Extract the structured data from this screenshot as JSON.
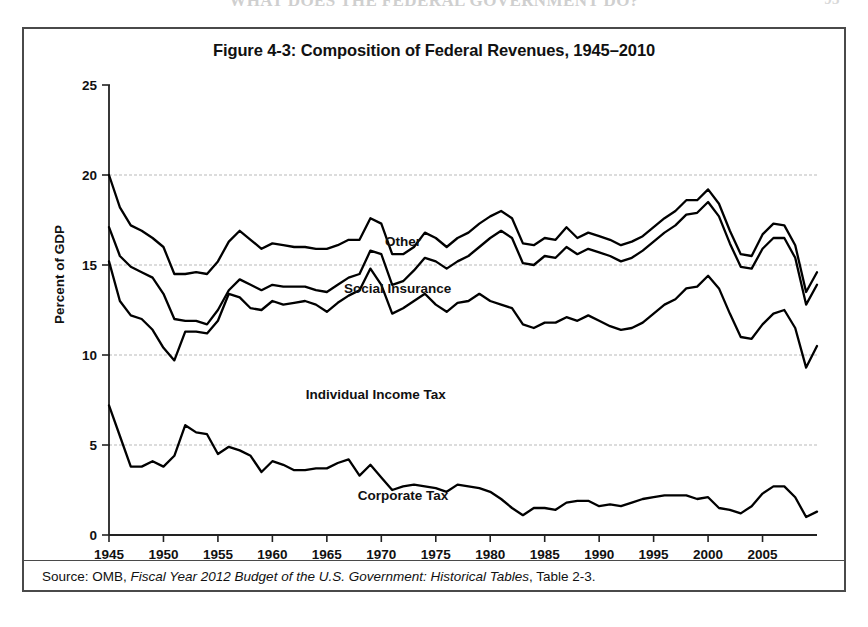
{
  "page": {
    "running_head": "WHAT DOES THE FEDERAL GOVERNMENT DO?",
    "page_number": "93"
  },
  "figure": {
    "title": "Figure 4-3: Composition of Federal Revenues, 1945–2010",
    "source_prefix": "Source: OMB, ",
    "source_italic": "Fiscal Year 2012 Budget of the U.S. Government: Historical Tables",
    "source_suffix": ", Table 2-3."
  },
  "axes": {
    "ylabel": "Percent of GDP",
    "yticks": [
      "0",
      "5",
      "10",
      "15",
      "20",
      "25"
    ],
    "xticks": [
      "1945",
      "1950",
      "1955",
      "1960",
      "1965",
      "1970",
      "1975",
      "1980",
      "1985",
      "1990",
      "1995",
      "2000",
      "2005"
    ]
  },
  "series_labels": {
    "other": "Other",
    "social_insurance": "Social Insurance",
    "individual_income_tax": "Individual Income Tax",
    "corporate_tax": "Corporate Tax"
  },
  "chart_data": {
    "type": "line",
    "title": "Figure 4-3: Composition of Federal Revenues, 1945–2010",
    "xlabel": "",
    "ylabel": "Percent of GDP",
    "xlim": [
      1945,
      2010
    ],
    "ylim": [
      0,
      25
    ],
    "ytick_interval": 5,
    "xtick_interval": 5,
    "grid": "horizontal-dashed",
    "legend": "inline-annotations",
    "note": "Cumulative (stacked) lines: each plotted line is the running total of the components beneath it. Corporate Tax is the lowest line; Individual Income Tax line = corporate + individual is NOT plotted separately — the stack order from bottom of the upper band upward is Individual Income Tax, Social Insurance, Other, each drawn as a cumulative total excluding corporate which is shown separately at the bottom.",
    "x": [
      1945,
      1946,
      1947,
      1948,
      1949,
      1950,
      1951,
      1952,
      1953,
      1954,
      1955,
      1956,
      1957,
      1958,
      1959,
      1960,
      1961,
      1962,
      1963,
      1964,
      1965,
      1966,
      1967,
      1968,
      1969,
      1970,
      1971,
      1972,
      1973,
      1974,
      1975,
      1976,
      1977,
      1978,
      1979,
      1980,
      1981,
      1982,
      1983,
      1984,
      1985,
      1986,
      1987,
      1988,
      1989,
      1990,
      1991,
      1992,
      1993,
      1994,
      1995,
      1996,
      1997,
      1998,
      1999,
      2000,
      2001,
      2002,
      2003,
      2004,
      2005,
      2006,
      2007,
      2008,
      2009,
      2010
    ],
    "series": [
      {
        "name": "Total (Other stacked on top) — top line",
        "label": "Other",
        "values": [
          20.0,
          18.2,
          17.2,
          16.9,
          16.5,
          16.0,
          14.5,
          14.5,
          14.6,
          14.5,
          15.2,
          16.3,
          16.9,
          16.4,
          15.9,
          16.2,
          16.1,
          16.0,
          16.0,
          15.9,
          15.9,
          16.1,
          16.4,
          16.4,
          17.6,
          17.3,
          15.6,
          15.6,
          16.0,
          16.8,
          16.5,
          16.0,
          16.5,
          16.8,
          17.3,
          17.7,
          18.0,
          17.6,
          16.2,
          16.1,
          16.5,
          16.4,
          17.1,
          16.5,
          16.8,
          16.6,
          16.4,
          16.1,
          16.3,
          16.6,
          17.1,
          17.6,
          18.0,
          18.6,
          18.6,
          19.2,
          18.4,
          16.9,
          15.6,
          15.5,
          16.7,
          17.3,
          17.2,
          16.1,
          13.5,
          14.6
        ],
        "comment": "Total federal revenues as % of GDP; Other = this line minus the Social Insurance line."
      },
      {
        "name": "Individual Income + Social Insurance — middle line",
        "label": "Social Insurance",
        "values": [
          17.1,
          15.5,
          14.9,
          14.6,
          14.3,
          13.4,
          12.0,
          11.9,
          11.9,
          11.7,
          12.5,
          13.6,
          14.2,
          13.9,
          13.6,
          13.9,
          13.8,
          13.8,
          13.8,
          13.6,
          13.5,
          13.9,
          14.3,
          14.5,
          15.8,
          15.6,
          13.9,
          14.1,
          14.7,
          15.4,
          15.2,
          14.8,
          15.2,
          15.5,
          16.0,
          16.5,
          16.9,
          16.5,
          15.1,
          15.0,
          15.5,
          15.4,
          16.0,
          15.6,
          15.9,
          15.7,
          15.5,
          15.2,
          15.4,
          15.8,
          16.3,
          16.8,
          17.2,
          17.8,
          17.9,
          18.5,
          17.7,
          16.2,
          14.9,
          14.8,
          15.9,
          16.5,
          16.5,
          15.4,
          12.8,
          13.9
        ],
        "comment": "Individual income tax plus social insurance payroll taxes, as % of GDP."
      },
      {
        "name": "Individual Income Tax — lower band line",
        "label": "Individual Income Tax",
        "values": [
          15.2,
          13.0,
          12.2,
          12.0,
          11.4,
          10.4,
          9.7,
          11.3,
          11.3,
          11.2,
          11.9,
          13.4,
          13.2,
          12.6,
          12.5,
          13.0,
          12.8,
          12.9,
          13.0,
          12.8,
          12.4,
          12.9,
          13.3,
          13.6,
          14.8,
          13.9,
          12.3,
          12.6,
          13.0,
          13.4,
          12.8,
          12.4,
          12.9,
          13.0,
          13.4,
          13.0,
          12.8,
          12.6,
          11.7,
          11.5,
          11.8,
          11.8,
          12.1,
          11.9,
          12.2,
          11.9,
          11.6,
          11.4,
          11.5,
          11.8,
          12.3,
          12.8,
          13.1,
          13.7,
          13.8,
          14.4,
          13.7,
          12.3,
          11.0,
          10.9,
          11.7,
          12.3,
          12.5,
          11.5,
          9.3,
          10.5
        ],
        "comment": "Individual income tax receipts as % of GDP (drawn as the lowest line of the upper band)."
      },
      {
        "name": "Corporate Tax",
        "label": "Corporate Tax",
        "values": [
          7.2,
          5.5,
          3.8,
          3.8,
          4.1,
          3.8,
          4.4,
          6.1,
          5.7,
          5.6,
          4.5,
          4.9,
          4.7,
          4.4,
          3.5,
          4.1,
          3.9,
          3.6,
          3.6,
          3.7,
          3.7,
          4.0,
          4.2,
          3.3,
          3.9,
          3.2,
          2.5,
          2.7,
          2.8,
          2.7,
          2.6,
          2.4,
          2.8,
          2.7,
          2.6,
          2.4,
          2.0,
          1.5,
          1.1,
          1.5,
          1.5,
          1.4,
          1.8,
          1.9,
          1.9,
          1.6,
          1.7,
          1.6,
          1.8,
          2.0,
          2.1,
          2.2,
          2.2,
          2.2,
          2.0,
          2.1,
          1.5,
          1.4,
          1.2,
          1.6,
          2.3,
          2.7,
          2.7,
          2.1,
          1.0,
          1.3
        ],
        "comment": "Corporation income tax receipts as % of GDP."
      }
    ]
  }
}
